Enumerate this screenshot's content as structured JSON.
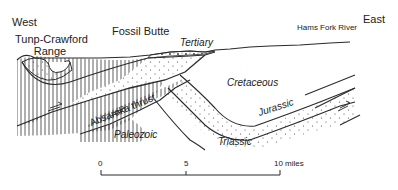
{
  "diagram": {
    "type": "geologic-cross-section",
    "directions": {
      "west": "West",
      "east": "East"
    },
    "place_labels": {
      "range": [
        "Tunp-Crawford",
        "Range"
      ],
      "butte": "Fossil Butte",
      "river": "Hams Fork River"
    },
    "units": {
      "tertiary": "Tertiary",
      "cretaceous": "Cretaceous",
      "jurassic": "Jurassic",
      "triassic": "Triassic",
      "paleozoic": "Paleozoic"
    },
    "structures": {
      "thrust": "Absaroka thrust"
    },
    "scale_bar": {
      "ticks": [
        "0",
        "5",
        "10 miles"
      ]
    },
    "colors": {
      "line": "#2a2a2a",
      "background": "#ffffff"
    }
  }
}
